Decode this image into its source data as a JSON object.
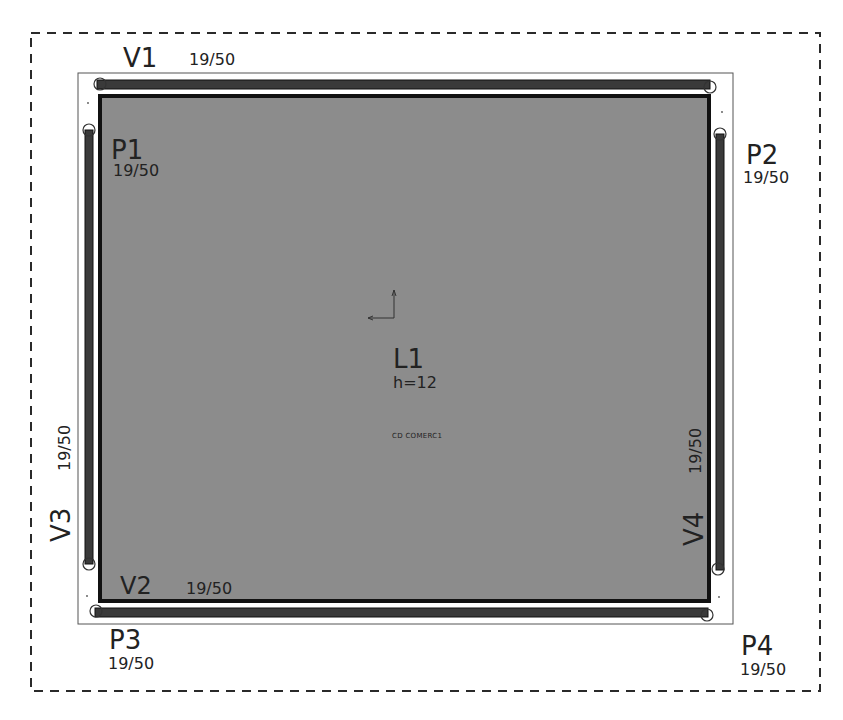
{
  "slab": {
    "name": "L1",
    "height_label": "h=12",
    "load_label": "CD COMERC1",
    "fill_color": "#8c8c8c"
  },
  "beams": [
    {
      "id": "V1",
      "section": "19/50",
      "orientation": "horizontal",
      "position": "top"
    },
    {
      "id": "V2",
      "section": "19/50",
      "orientation": "horizontal",
      "position": "bottom"
    },
    {
      "id": "V3",
      "section": "19/50",
      "orientation": "vertical",
      "position": "left"
    },
    {
      "id": "V4",
      "section": "19/50",
      "orientation": "vertical",
      "position": "right"
    }
  ],
  "pillars": [
    {
      "id": "P1",
      "section": "19/50",
      "position": "top-left"
    },
    {
      "id": "P2",
      "section": "19/50",
      "position": "top-right"
    },
    {
      "id": "P3",
      "section": "19/50",
      "position": "bottom-left"
    },
    {
      "id": "P4",
      "section": "19/50",
      "position": "bottom-right"
    }
  ],
  "colors": {
    "beam": "#3a3a3a",
    "outline": "#111111",
    "dashed_border": "#2a2a2a",
    "background": "#ffffff"
  }
}
